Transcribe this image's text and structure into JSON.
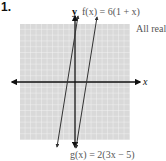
{
  "problem": {
    "number": "1."
  },
  "graph": {
    "y_axis_label": "y",
    "x_axis_label": "x",
    "f_label": "f(x) = 6(1 + x)",
    "g_label": "g(x) = 2(3x − 5)",
    "answer": "All reals"
  },
  "colors": {
    "grid_bg": "#dcdcdc",
    "grid_line": "#f4f4f4",
    "axis": "#111111",
    "line": "#333333"
  }
}
